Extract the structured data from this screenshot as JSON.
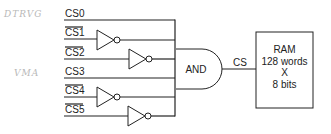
{
  "annotations": {
    "top_left": "DTRVG",
    "middle_left": "VMA"
  },
  "signals": [
    {
      "label": "CS0",
      "inverted": false,
      "has_inverter": false
    },
    {
      "label": "CS1",
      "inverted": true,
      "has_inverter": true
    },
    {
      "label": "CS2",
      "inverted": true,
      "has_inverter": true
    },
    {
      "label": "CS3",
      "inverted": false,
      "has_inverter": false
    },
    {
      "label": "CS4",
      "inverted": true,
      "has_inverter": true
    },
    {
      "label": "CS5",
      "inverted": true,
      "has_inverter": true
    }
  ],
  "and_gate": {
    "label": "AND"
  },
  "output_signal": {
    "label": "CS"
  },
  "ram": {
    "line1": "RAM",
    "line2": "128 words",
    "line3": "X",
    "line4": "8 bits"
  }
}
